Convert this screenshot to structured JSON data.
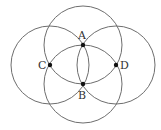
{
  "diagram": {
    "type": "four-circle construction",
    "radius": 39,
    "stroke_color": "#6e6e6e",
    "point_color": "#111111",
    "points": [
      {
        "label": "A",
        "x": 83,
        "y": 45,
        "label_x": 78,
        "label_y": 39
      },
      {
        "label": "B",
        "x": 83,
        "y": 84,
        "label_x": 78,
        "label_y": 99
      },
      {
        "label": "C",
        "x": 50,
        "y": 65,
        "label_x": 38,
        "label_y": 69
      },
      {
        "label": "D",
        "x": 116,
        "y": 65,
        "label_x": 120,
        "label_y": 69
      }
    ],
    "circles": [
      {
        "center": "A",
        "cx": 83,
        "cy": 45
      },
      {
        "center": "B",
        "cx": 83,
        "cy": 84
      },
      {
        "center": "C",
        "cx": 50,
        "cy": 65
      },
      {
        "center": "D",
        "cx": 116,
        "cy": 65
      }
    ]
  }
}
